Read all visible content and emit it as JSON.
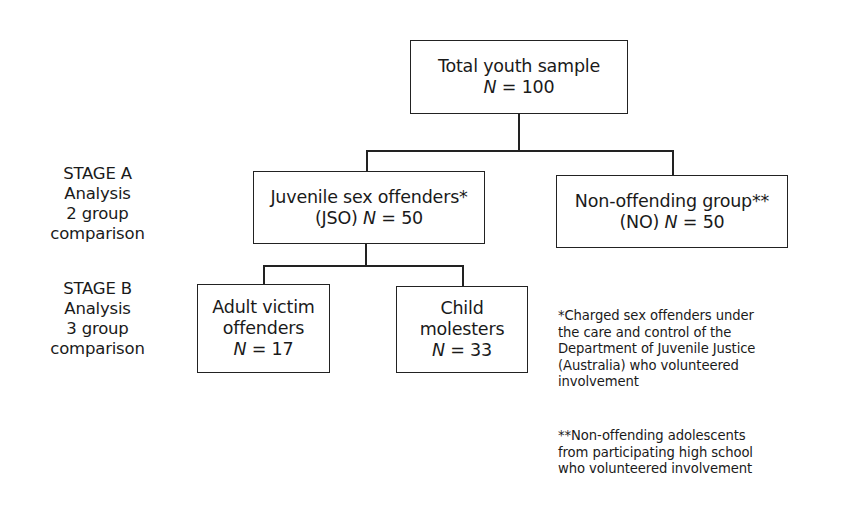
{
  "diagram": {
    "type": "flowchart-tree",
    "root": {
      "label": "Total youth sample",
      "n_prefix": "N",
      "n_suffix": " = 100"
    },
    "stage_a": {
      "lines": [
        "STAGE A",
        "Analysis",
        "2 group",
        "comparison"
      ],
      "groups": [
        {
          "label": "Juvenile sex offenders*",
          "abbr": "(JSO) ",
          "n_prefix": "N",
          "n_suffix": " = 50"
        },
        {
          "label": "Non-offending group**",
          "abbr": "(NO) ",
          "n_prefix": "N",
          "n_suffix": " = 50"
        }
      ]
    },
    "stage_b": {
      "lines": [
        "STAGE B",
        "Analysis",
        "3 group",
        "comparison"
      ],
      "groups": [
        {
          "label_line1": "Adult victim",
          "label_line2": "offenders",
          "n_prefix": "N",
          "n_suffix": " = 17"
        },
        {
          "label_line1": "Child",
          "label_line2": "molesters",
          "n_prefix": "N",
          "n_suffix": " = 33"
        }
      ]
    },
    "footnotes": [
      {
        "lines": [
          "*Charged sex offenders under",
          "the care and control of the",
          "Department of Juvenile Justice",
          "(Australia) who volunteered",
          "involvement"
        ]
      },
      {
        "lines": [
          "**Non-offending adolescents",
          "from participating high school",
          "who volunteered involvement"
        ]
      }
    ],
    "colors": {
      "line": "#222222",
      "text": "#1a1a1a",
      "background": "#ffffff"
    }
  }
}
